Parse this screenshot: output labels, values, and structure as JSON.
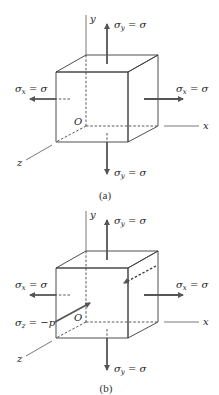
{
  "figure": {
    "panels": [
      {
        "id": "a",
        "caption": "(a)",
        "axes": {
          "x": "x",
          "y": "y",
          "z": "z",
          "origin": "O"
        },
        "labels": {
          "sigma_y_top": {
            "sym": "σ",
            "sub": "y",
            "rest": " = σ"
          },
          "sigma_y_bottom": {
            "sym": "σ",
            "sub": "y",
            "rest": " = σ"
          },
          "sigma_x_left": {
            "sym": "σ",
            "sub": "x",
            "rest": " = σ"
          },
          "sigma_x_right": {
            "sym": "σ",
            "sub": "x",
            "rest": " = σ"
          }
        }
      },
      {
        "id": "b",
        "caption": "(b)",
        "axes": {
          "x": "x",
          "y": "y",
          "z": "z",
          "origin": "O"
        },
        "labels": {
          "sigma_y_top": {
            "sym": "σ",
            "sub": "y",
            "rest": " = σ"
          },
          "sigma_y_bottom": {
            "sym": "σ",
            "sub": "y",
            "rest": " = σ"
          },
          "sigma_x_left": {
            "sym": "σ",
            "sub": "x",
            "rest": " = σ"
          },
          "sigma_x_right": {
            "sym": "σ",
            "sub": "x",
            "rest": " = σ"
          },
          "sigma_z": {
            "sym": "σ",
            "sub": "z",
            "rest": " = −p"
          }
        }
      }
    ],
    "colors": {
      "front_face": "#d3d3d3",
      "top_face": "#e8e8e8",
      "right_face": "#c4c4c4",
      "edge": "#3a3a3a",
      "arrow": "#555555"
    }
  }
}
